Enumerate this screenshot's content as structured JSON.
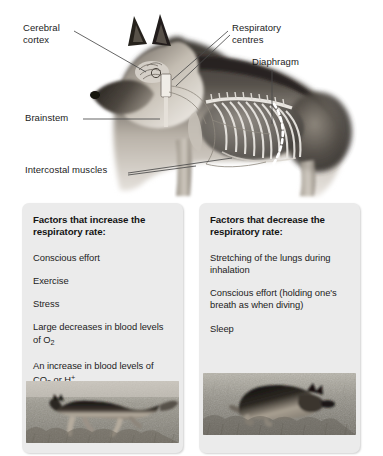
{
  "figure": {
    "name": "respiratory-control-dog-anatomy",
    "labels": [
      {
        "id": "cerebral-cortex",
        "text": "Cerebral\ncortex"
      },
      {
        "id": "respiratory-centres",
        "text": "Respiratory\ncentres"
      },
      {
        "id": "diaphragm",
        "text": "Diaphragm"
      },
      {
        "id": "brainstem",
        "text": "Brainstem"
      },
      {
        "id": "intercostal-muscles",
        "text": "Intercostal muscles"
      }
    ]
  },
  "panels": {
    "increase": {
      "title": "Factors that increase the respiratory rate:",
      "items": [
        {
          "text": "Conscious effort"
        },
        {
          "text": "Exercise"
        },
        {
          "text": "Stress"
        },
        {
          "text": "Large decreases in blood levels of O",
          "sub": "2",
          "tail": ""
        },
        {
          "text": "An increase in blood levels of CO",
          "sub": "2",
          "tail": " or H",
          "sup": "+"
        }
      ],
      "photo_caption": "running German shepherd dog on grass"
    },
    "decrease": {
      "title": "Factors that decrease the respiratory rate:",
      "items": [
        {
          "text": "Stretching of the lungs during inhalation"
        },
        {
          "text": "Conscious effort (holding one's breath as when diving)"
        },
        {
          "text": "Sleep"
        }
      ],
      "photo_caption": "sleeping German shepherd dog curled on grass"
    }
  },
  "colors": {
    "panel_background": "#ebebeb",
    "text": "#1c1c1c",
    "page_background": "#ffffff",
    "grass": "#9a9a92",
    "dog_dark": "#2b2722",
    "dog_light": "#c9c2b6"
  }
}
